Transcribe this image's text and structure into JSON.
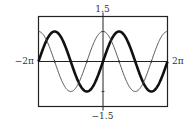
{
  "chart_data": {
    "type": "line",
    "title": "",
    "xlabel": "",
    "ylabel": "",
    "xlim": [
      -6.283185307,
      6.283185307
    ],
    "ylim": [
      -1.5,
      1.5
    ],
    "x_tick_labels": {
      "min": "−2π",
      "max": "2π"
    },
    "y_tick_labels": {
      "min": "−1.5",
      "max": "1.5"
    },
    "grid": false,
    "legend": "none",
    "series": [
      {
        "name": "sin x",
        "function": "sin",
        "style": "thick",
        "color": "#111111"
      },
      {
        "name": "cos x",
        "function": "cos",
        "style": "thin",
        "color": "#444444"
      }
    ]
  }
}
